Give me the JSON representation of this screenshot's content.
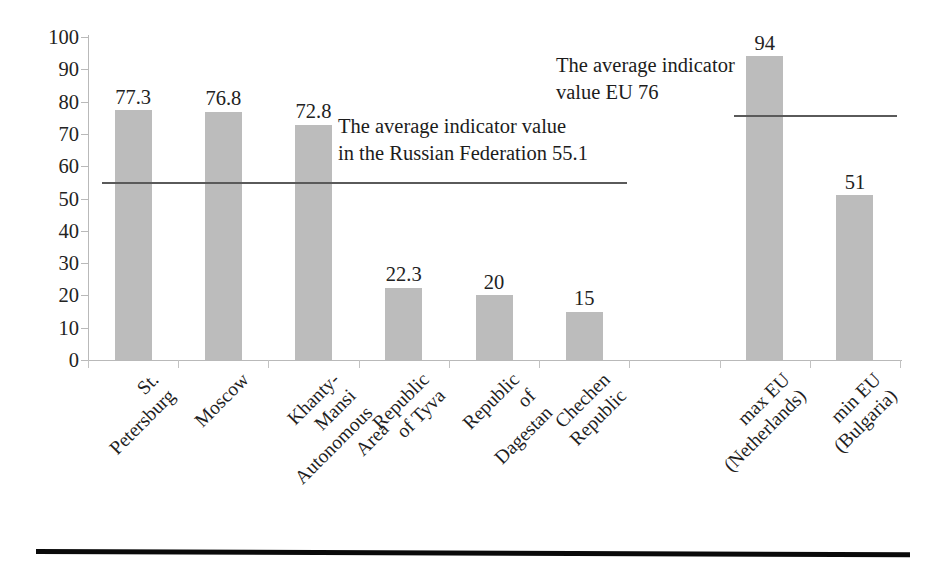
{
  "chart_data": {
    "type": "bar",
    "title": "",
    "xlabel": "",
    "ylabel": "",
    "ylim": [
      0,
      100
    ],
    "ytick_step": 10,
    "yticks": [
      "100",
      "90",
      "80",
      "70",
      "60",
      "50",
      "40",
      "30",
      "20",
      "10",
      "0"
    ],
    "grid": false,
    "legend": "none",
    "bar_color": "#bcbcbc",
    "reference_line_color": "#5a5a5a",
    "categories": [
      "St. Petersburg",
      "Moscow",
      "Khanty-Mansi\nAutonomous Area",
      "Republic of Tyva",
      "Republic of Dagestan",
      "Chechen Republic",
      "",
      "max EU (Netherlands)",
      "min EU (Bulgaria)"
    ],
    "values": [
      77.3,
      76.8,
      72.8,
      22.3,
      20,
      15,
      null,
      94,
      51
    ],
    "value_labels": [
      "77.3",
      "76.8",
      "72.8",
      "22.3",
      "20",
      "15",
      "",
      "94",
      "51"
    ],
    "reference_lines": [
      {
        "name": "russian-federation-average",
        "value": 55.1,
        "label": "The average indicator value\nin the Russian Federation 55.1",
        "spans_categories": [
          0,
          5
        ]
      },
      {
        "name": "eu-average",
        "value": 76,
        "label": "The average indicator\nvalue EU 76",
        "spans_categories": [
          7,
          8
        ]
      }
    ]
  },
  "annotations": {
    "russian_federation": "The average indicator value\nin the Russian Federation 55.1",
    "european_union": "The average indicator\nvalue EU 76"
  }
}
